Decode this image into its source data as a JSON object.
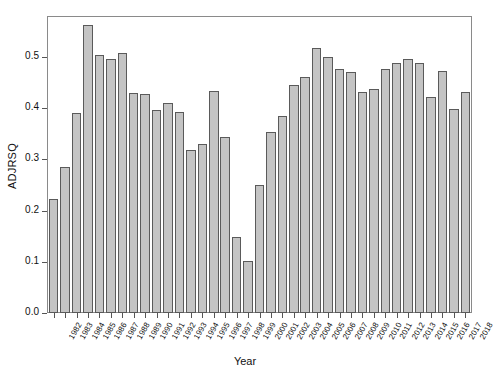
{
  "chart_data": {
    "type": "bar",
    "title": "",
    "xlabel": "Year",
    "ylabel": "ADJRSQ",
    "ylim": [
      0.0,
      0.58
    ],
    "yticks": [
      0.0,
      0.1,
      0.2,
      0.3,
      0.4,
      0.5
    ],
    "ytick_labels": [
      "0.0",
      "0.1",
      "0.2",
      "0.3",
      "0.4",
      "0.5"
    ],
    "grid": false,
    "legend": null,
    "bar_fill_color": "#c4c4c4",
    "bar_border_color": "#5a5a5a",
    "categories": [
      "1982",
      "1983",
      "1984",
      "1985",
      "1986",
      "1987",
      "1988",
      "1989",
      "1990",
      "1991",
      "1992",
      "1993",
      "1994",
      "1995",
      "1996",
      "1997",
      "1998",
      "1999",
      "2000",
      "2001",
      "2002",
      "2003",
      "2004",
      "2005",
      "2006",
      "2007",
      "2008",
      "2009",
      "2010",
      "2011",
      "2012",
      "2013",
      "2014",
      "2015",
      "2016",
      "2017",
      "2018"
    ],
    "values": [
      0.222,
      0.285,
      0.391,
      0.563,
      0.503,
      0.497,
      0.507,
      0.43,
      0.428,
      0.396,
      0.41,
      0.393,
      0.318,
      0.331,
      0.434,
      0.344,
      0.148,
      0.102,
      0.25,
      0.353,
      0.385,
      0.446,
      0.46,
      0.517,
      0.5,
      0.477,
      0.47,
      0.432,
      0.437,
      0.477,
      0.489,
      0.497,
      0.488,
      0.421,
      0.472,
      0.398,
      0.432
    ]
  },
  "axes": {
    "y_label": "ADJRSQ",
    "x_label": "Year"
  }
}
